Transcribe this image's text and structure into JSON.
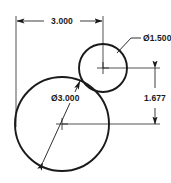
{
  "drawing": {
    "title": "Two Tangent Circles Dimensioned Sketch",
    "background_color": "#ffffff",
    "line_color": "#1a1a1a",
    "dimension_color": "#1a1a1a",
    "text_color": "#1a1a1a",
    "units": "inches",
    "dimensions": [
      {
        "id": "horizontal-center-distance",
        "label": "3.000",
        "type": "linear-horizontal",
        "value": 3.0,
        "orientation": "top"
      },
      {
        "id": "small-circle-diameter",
        "label": "Ø1.500",
        "type": "diameter",
        "value": 1.5,
        "orientation": "leader-upper-right"
      },
      {
        "id": "large-circle-diameter",
        "label": "Ø3.000",
        "type": "diameter",
        "value": 3.0,
        "orientation": "leader-diagonal"
      },
      {
        "id": "vertical-center-distance",
        "label": "1.677",
        "type": "linear-vertical",
        "value": 1.677,
        "orientation": "right"
      }
    ],
    "circles": [
      {
        "id": "large-circle",
        "diameter_label": "Ø3.000",
        "center_x": 62,
        "center_y": 124,
        "radius": 47
      },
      {
        "id": "small-circle",
        "diameter_label": "Ø1.500",
        "center_x": 103,
        "center_y": 68,
        "radius": 24
      }
    ]
  }
}
